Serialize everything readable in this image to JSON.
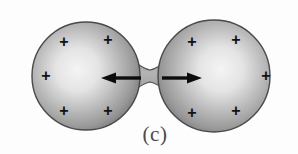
{
  "figure": {
    "label": "(c)",
    "label_position": {
      "x": 155,
      "y": 134
    },
    "background_color": "#fdfdfd",
    "canvas": {
      "width": 298,
      "height": 154
    }
  },
  "colors": {
    "sphere_edge": "#6f6f6f",
    "sphere_mid": "#a8a8a8",
    "sphere_highlight": "#f2f2f2",
    "outline": "#3b3b3b",
    "arrow": "#0d0d0d",
    "plus": "#121212",
    "label": "#4a4a4a"
  },
  "shapes": {
    "left_sphere": {
      "cx": 86,
      "cy": 76,
      "r": 54,
      "name": "left-fragment"
    },
    "right_sphere": {
      "cx": 214,
      "cy": 76,
      "r": 56,
      "name": "right-fragment"
    },
    "neck": {
      "cx": 150,
      "cy": 77,
      "half_height": 7,
      "name": "scission-neck"
    }
  },
  "arrows": [
    {
      "name": "left-repulsion-arrow",
      "direction": "left",
      "tail_x": 141,
      "head_x": 103,
      "y": 78,
      "label": "left force arrow"
    },
    {
      "name": "right-repulsion-arrow",
      "direction": "right",
      "tail_x": 162,
      "head_x": 201,
      "y": 78,
      "label": "right force arrow"
    }
  ],
  "charges": {
    "symbol": "+",
    "left": [
      {
        "x": 64,
        "y": 42
      },
      {
        "x": 108,
        "y": 40
      },
      {
        "x": 46,
        "y": 76
      },
      {
        "x": 64,
        "y": 111
      },
      {
        "x": 108,
        "y": 111
      }
    ],
    "right": [
      {
        "x": 192,
        "y": 42
      },
      {
        "x": 236,
        "y": 40
      },
      {
        "x": 266,
        "y": 76
      },
      {
        "x": 192,
        "y": 113
      },
      {
        "x": 236,
        "y": 111
      }
    ]
  }
}
